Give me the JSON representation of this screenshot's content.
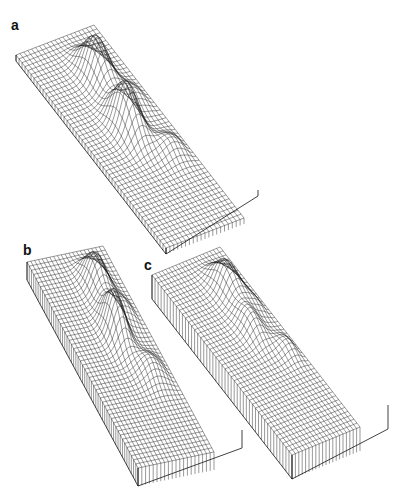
{
  "chart_data": [
    {
      "type": "surface",
      "panel_label": "a",
      "title": "",
      "description": "3D wireframe surface on rectangular slab with two main peaks and a ridge",
      "grid": {
        "rows": 50,
        "cols": 20
      },
      "label_pos": [
        11,
        18
      ],
      "corners": {
        "tl": [
          16,
          55
        ],
        "tr": [
          94,
          25
        ],
        "br": [
          258,
          190
        ],
        "bl": [
          166,
          248
        ]
      },
      "thickness": 6,
      "peaks": [
        {
          "u": 0.62,
          "v": 0.22,
          "height": 42,
          "sx": 0.1,
          "sy": 0.07
        },
        {
          "u": 0.52,
          "v": 0.47,
          "height": 48,
          "sx": 0.1,
          "sy": 0.07
        },
        {
          "u": 0.8,
          "v": 0.36,
          "height": 12,
          "sx": 0.1,
          "sy": 0.05
        },
        {
          "u": 0.78,
          "v": 0.62,
          "height": 14,
          "sx": 0.12,
          "sy": 0.05
        }
      ]
    },
    {
      "type": "surface",
      "panel_label": "b",
      "title": "",
      "description": "3D wireframe surface, thicker slab, two main peaks",
      "grid": {
        "rows": 50,
        "cols": 20
      },
      "label_pos": [
        23,
        243
      ],
      "corners": {
        "tl": [
          27,
          262
        ],
        "tr": [
          103,
          246
        ],
        "br": [
          242,
          430
        ],
        "bl": [
          138,
          468
        ]
      },
      "thickness": 18,
      "peaks": [
        {
          "u": 0.66,
          "v": 0.18,
          "height": 34,
          "sx": 0.1,
          "sy": 0.07
        },
        {
          "u": 0.58,
          "v": 0.4,
          "height": 44,
          "sx": 0.09,
          "sy": 0.07
        },
        {
          "u": 0.82,
          "v": 0.32,
          "height": 12,
          "sx": 0.08,
          "sy": 0.05
        },
        {
          "u": 0.75,
          "v": 0.6,
          "height": 16,
          "sx": 0.12,
          "sy": 0.06
        }
      ]
    },
    {
      "type": "surface",
      "panel_label": "c",
      "title": "",
      "description": "3D wireframe surface, thicker slab, smoother lower peaks",
      "grid": {
        "rows": 46,
        "cols": 20
      },
      "label_pos": [
        144,
        258
      ],
      "corners": {
        "tl": [
          152,
          275
        ],
        "tr": [
          220,
          247
        ],
        "br": [
          388,
          405
        ],
        "bl": [
          292,
          455
        ]
      },
      "thickness": 24,
      "peaks": [
        {
          "u": 0.7,
          "v": 0.2,
          "height": 30,
          "sx": 0.11,
          "sy": 0.07
        },
        {
          "u": 0.62,
          "v": 0.4,
          "height": 20,
          "sx": 0.1,
          "sy": 0.07
        },
        {
          "u": 0.85,
          "v": 0.32,
          "height": 8,
          "sx": 0.09,
          "sy": 0.05
        },
        {
          "u": 0.85,
          "v": 0.55,
          "height": 10,
          "sx": 0.1,
          "sy": 0.05
        }
      ]
    }
  ],
  "labels": {
    "a": "a",
    "b": "b",
    "c": "c"
  },
  "colors": {
    "line": "#1a1a1a",
    "background": "#ffffff"
  }
}
